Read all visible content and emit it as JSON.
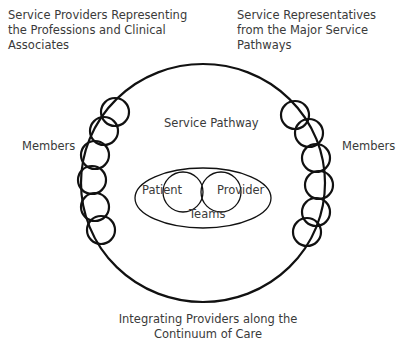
{
  "labels": {
    "top_left": "Service Providers Representing\nthe Professions and Clinical\nAssociates",
    "top_right": "Service Representatives\nfrom the Major Service\nPathways",
    "members_left": "Members",
    "members_right": "Members",
    "service_pathway": "Service Pathway",
    "patient": "Patient",
    "provider": "Provider",
    "teams": "Teams",
    "bottom": "Integrating Providers along the\nContinuum of Care"
  }
}
